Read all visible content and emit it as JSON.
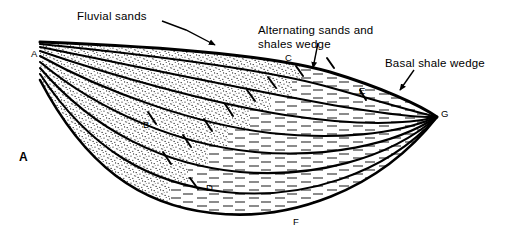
{
  "figure": {
    "caption": "A",
    "type": "geologic-cross-section"
  },
  "annotations": [
    {
      "id": "fluvial-sands",
      "text": "Fluvial sands",
      "leader": true
    },
    {
      "id": "alternating-sands-shales",
      "text": "Alternating sands and shales wedge",
      "line1": "Alternating sands and",
      "line2": "shales  wedge",
      "leader": true
    },
    {
      "id": "basal-shale-wedge",
      "text": "Basal shale wedge",
      "leader": true
    }
  ],
  "points": [
    {
      "id": "A",
      "label": "A"
    },
    {
      "id": "B",
      "label": "B"
    },
    {
      "id": "C",
      "label": "C"
    },
    {
      "id": "D",
      "label": "D"
    },
    {
      "id": "E",
      "label": "E"
    },
    {
      "id": "F",
      "label": "F"
    },
    {
      "id": "G",
      "label": "G"
    }
  ],
  "colors": {
    "ink": "#000000",
    "background": "#ffffff",
    "stipple": "#1a1a1a",
    "dash": "#2b2b2b"
  },
  "patterns": [
    {
      "id": "sand",
      "name": "stippled",
      "meaning": "sand"
    },
    {
      "id": "shale",
      "name": "horizontal-dashes",
      "meaning": "shale"
    }
  ]
}
